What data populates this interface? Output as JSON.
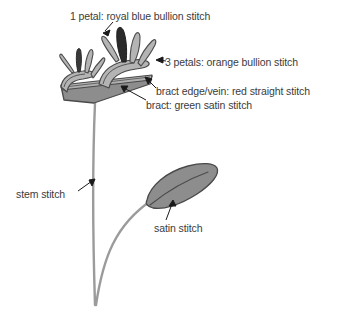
{
  "figure": {
    "background_color": "#ffffff",
    "annotations": [
      {
        "id": "blue-petal",
        "text": "1 petal: royal blue bullion stitch",
        "target": "dark upper petal",
        "arrow": "down-left"
      },
      {
        "id": "orange-petals",
        "text": "3 petals: orange bullion stitch",
        "target": "light gray petals",
        "arrow": "left"
      },
      {
        "id": "bract-edge",
        "text": "bract edge/vein: red straight stitch",
        "target": "upper edge of bract",
        "arrow": "up-left"
      },
      {
        "id": "bract-body",
        "text": "bract: green satin stitch",
        "target": "bract body",
        "arrow": "up-right"
      },
      {
        "id": "stem",
        "text": "stem stitch",
        "target": "main stem",
        "arrow": "up-right"
      },
      {
        "id": "leaf",
        "text": "satin stitch",
        "target": "leaf",
        "arrow": "up"
      }
    ],
    "colors": {
      "petal_dark": "#2b2b2b",
      "petal_light": "#b4b4b4",
      "petal_mid": "#9a9a9a",
      "bract_fill": "#8d8d8d",
      "bract_top": "#a8a8a8",
      "leaf_fill": "#8d8d8d",
      "stem": "#9b9b9b",
      "outline": "#4a4a4a",
      "text": "#3b3b3b",
      "leader": "#1a1a1a"
    },
    "parts": [
      {
        "name": "petal-blue",
        "label": "royal blue bullion stitch petal",
        "count": 1
      },
      {
        "name": "petal-orange",
        "label": "orange bullion stitch petals",
        "count": 3
      },
      {
        "name": "bract",
        "label": "green satin stitch bract",
        "count": 1
      },
      {
        "name": "bract-edge",
        "label": "red straight stitch bract edge/vein",
        "count": 1
      },
      {
        "name": "stem",
        "label": "stem stitch stem",
        "count": 1
      },
      {
        "name": "leaf",
        "label": "satin stitch leaf",
        "count": 1
      }
    ]
  }
}
